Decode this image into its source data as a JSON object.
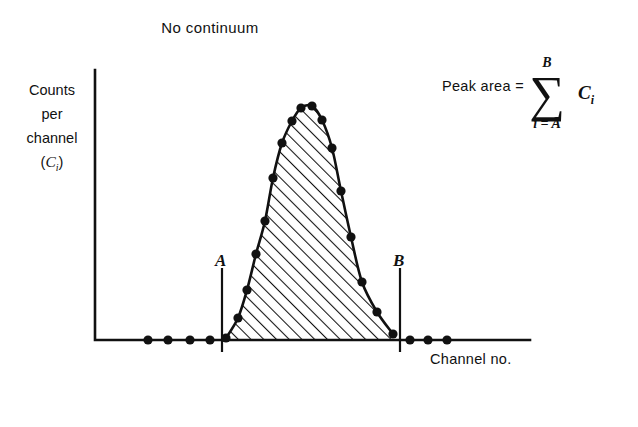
{
  "figure": {
    "title": "No continuum",
    "caption": "(a)",
    "axes": {
      "y_label_lines": [
        "Counts",
        "per",
        "channel"
      ],
      "y_label_symbol_base": "C",
      "y_label_symbol_sub": "i",
      "x_label": "Channel no."
    },
    "markers": [
      {
        "name": "A",
        "label": "A",
        "x": 222
      },
      {
        "name": "B",
        "label": "B",
        "x": 400
      }
    ],
    "formula": {
      "lhs": "Peak area  =",
      "upper_limit": "B",
      "lower_limit": "i = A",
      "sigma": "∑",
      "term_base": "C",
      "term_sub": "i"
    },
    "colors": {
      "ink": "#111111",
      "background": "#ffffff",
      "hatch": "#111111"
    }
  },
  "chart_data": {
    "type": "line",
    "title": "No continuum",
    "xlabel": "Channel no.",
    "ylabel": "Counts per channel (C_i)",
    "grid": false,
    "legend": null,
    "annotations": [
      {
        "text": "A",
        "type": "vertical-marker",
        "x_px": 222
      },
      {
        "text": "B",
        "type": "vertical-marker",
        "x_px": 400
      },
      {
        "text": "Peak area = sum from i = A to B of C_i",
        "type": "equation"
      }
    ],
    "axis_px": {
      "x_origin": 95,
      "y_baseline": 340,
      "x_end": 530,
      "y_top": 70
    },
    "series": [
      {
        "name": "spectrum channel counts",
        "marker": "filled-circle",
        "points_px": [
          [
            148,
            340
          ],
          [
            168,
            340
          ],
          [
            190,
            340
          ],
          [
            210,
            340
          ],
          [
            226,
            338
          ],
          [
            238,
            318
          ],
          [
            247,
            290
          ],
          [
            256,
            254
          ],
          [
            265,
            221
          ],
          [
            273,
            178
          ],
          [
            282,
            143
          ],
          [
            292,
            121
          ],
          [
            301,
            108
          ],
          [
            312,
            106
          ],
          [
            322,
            120
          ],
          [
            332,
            148
          ],
          [
            341,
            191
          ],
          [
            351,
            237
          ],
          [
            362,
            282
          ],
          [
            377,
            312
          ],
          [
            393,
            334
          ],
          [
            410,
            340
          ],
          [
            428,
            340
          ],
          [
            447,
            340
          ]
        ]
      }
    ],
    "shaded_region": {
      "fill": "hatch-45-degree",
      "from_marker": "A",
      "to_marker": "B",
      "description": "Peak area between channels A and B, hatched"
    }
  }
}
